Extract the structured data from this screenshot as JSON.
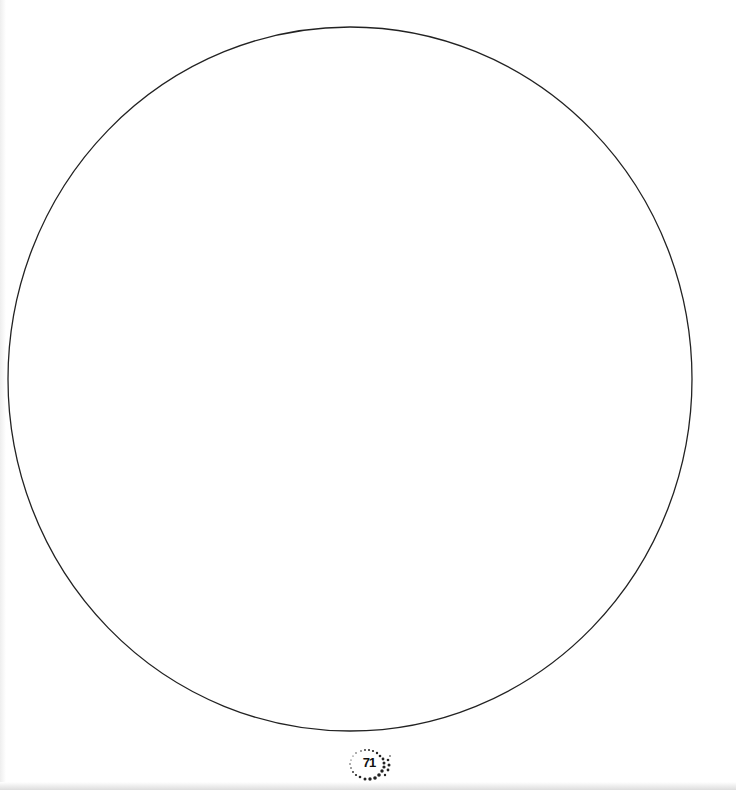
{
  "page": {
    "type": "blank drawing template page",
    "page_number": "71",
    "shape": "circle-outline",
    "colors": {
      "background": "#ffffff",
      "outline": "#222222",
      "badge_dots": "#222222"
    }
  }
}
